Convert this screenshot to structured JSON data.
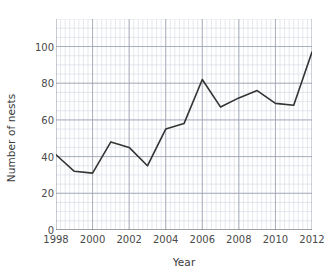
{
  "chart_data": {
    "type": "line",
    "title": "",
    "xlabel": "Year",
    "ylabel": "Number of nests",
    "x": [
      1998,
      1999,
      2000,
      2001,
      2002,
      2003,
      2004,
      2005,
      2006,
      2007,
      2008,
      2009,
      2010,
      2011,
      2012
    ],
    "values": [
      41,
      32,
      31,
      48,
      45,
      35,
      55,
      58,
      82,
      67,
      72,
      76,
      69,
      68,
      97
    ],
    "series": [
      {
        "name": "Number of nests",
        "values": [
          41,
          32,
          31,
          48,
          45,
          35,
          55,
          58,
          82,
          67,
          72,
          76,
          69,
          68,
          97
        ]
      }
    ],
    "xlim": [
      1998,
      2012
    ],
    "ylim": [
      0,
      115
    ],
    "xticks": [
      1998,
      2000,
      2002,
      2004,
      2006,
      2008,
      2010,
      2012
    ],
    "yticks": [
      0,
      20,
      40,
      60,
      80,
      100
    ],
    "xtick_labels": [
      "1998",
      "2000",
      "2002",
      "2004",
      "2006",
      "2008",
      "2010",
      "2012"
    ],
    "ytick_labels": [
      "0",
      "20",
      "40",
      "60",
      "80",
      "100"
    ],
    "grid": true,
    "minor_grid": true,
    "minor_grid_step_x": 0.25,
    "minor_grid_step_y": 5,
    "legend": null,
    "legend_position": "none",
    "annotations": [],
    "line_color": "#333333",
    "grid_major_color": "#9aa0b0",
    "grid_minor_color": "#d8dce6",
    "axis_color": "#555555",
    "text_color": "#3a3a3a"
  }
}
